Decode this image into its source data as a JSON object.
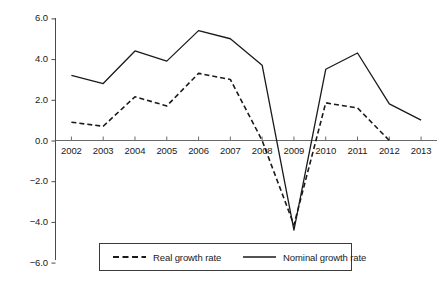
{
  "chart_data": {
    "type": "line",
    "title": "",
    "xlabel": "",
    "ylabel": "",
    "categories": [
      "2002",
      "2003",
      "2004",
      "2005",
      "2006",
      "2007",
      "2008",
      "2009",
      "2010",
      "2011",
      "2012",
      "2013"
    ],
    "ylim": [
      -6.0,
      6.0
    ],
    "xlim": [
      "2002",
      "2013"
    ],
    "grid": false,
    "legend_position": "bottom",
    "yticks": [
      "6.0",
      "4.0",
      "2.0",
      "0.0",
      "-2.0",
      "-4.0",
      "-6.0"
    ],
    "ytick_values": [
      6.0,
      4.0,
      2.0,
      0.0,
      -2.0,
      -4.0,
      -6.0
    ],
    "xticks": [
      "2002",
      "2003",
      "2004",
      "2005",
      "2006",
      "2007",
      "2008",
      "2009",
      "2010",
      "2011",
      "2012",
      "2013"
    ],
    "series": [
      {
        "name": "Real growth rate",
        "style": "dashed",
        "color": "#1a1a1a",
        "x": [
          "2002",
          "2003",
          "2004",
          "2005",
          "2006",
          "2007",
          "2008",
          "2009",
          "2010",
          "2011",
          "2012"
        ],
        "values": [
          0.9,
          0.7,
          2.15,
          1.7,
          3.3,
          3.0,
          0.0,
          -4.15,
          1.85,
          1.6,
          0.0
        ]
      },
      {
        "name": "Nominal growth rate",
        "style": "solid",
        "color": "#1a1a1a",
        "x": [
          "2002",
          "2003",
          "2004",
          "2005",
          "2006",
          "2007",
          "2008",
          "2009",
          "2010",
          "2011",
          "2012",
          "2013"
        ],
        "values": [
          3.2,
          2.8,
          4.4,
          3.9,
          5.4,
          5.0,
          3.7,
          -4.4,
          3.5,
          4.3,
          1.8,
          1.0
        ]
      }
    ]
  },
  "legend": {
    "items": [
      {
        "label": "Real growth rate",
        "style": "dashed"
      },
      {
        "label": "Nominal growth rate",
        "style": "solid"
      }
    ]
  },
  "axes": {
    "zero_line_label": "0.0",
    "y_axis_name": "growth-rate-percent"
  }
}
